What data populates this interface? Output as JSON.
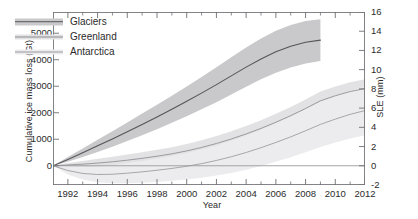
{
  "chart_data": {
    "type": "line",
    "title": "",
    "xlabel": "Year",
    "ylabel": "Cumulative ice mass loss (Gt)",
    "y2label": "SLE (mm)",
    "xlim": [
      1991,
      2012
    ],
    "ylim": [
      -726,
      5800
    ],
    "y2lim": [
      -2,
      16
    ],
    "grid": false,
    "legend_position": "top-left",
    "xticks": [
      1992,
      1994,
      1996,
      1998,
      2000,
      2002,
      2004,
      2006,
      2008,
      2010,
      2012
    ],
    "xticks_minor": [
      1993,
      1995,
      1997,
      1999,
      2001,
      2003,
      2005,
      2007,
      2009,
      2011
    ],
    "yticks": [
      0,
      1000,
      2000,
      3000,
      4000,
      5000
    ],
    "y2ticks": [
      -2,
      0,
      2,
      4,
      6,
      8,
      10,
      12,
      14,
      16
    ],
    "zero_line": 0,
    "series": [
      {
        "name": "Glaciers",
        "color": "#55555a",
        "band_color": "#c9c9cb",
        "x": [
          1991,
          1992,
          1993,
          1994,
          1995,
          1996,
          1997,
          1998,
          1999,
          2000,
          2001,
          2002,
          2003,
          2004,
          2005,
          2006,
          2007,
          2008,
          2009
        ],
        "values": [
          0,
          240,
          490,
          750,
          1010,
          1280,
          1560,
          1840,
          2130,
          2430,
          2740,
          3060,
          3390,
          3720,
          4030,
          4300,
          4510,
          4660,
          4740
        ],
        "lower": [
          0,
          150,
          330,
          520,
          720,
          930,
          1150,
          1380,
          1620,
          1870,
          2130,
          2400,
          2690,
          2980,
          3260,
          3510,
          3710,
          3860,
          3950
        ],
        "upper": [
          0,
          330,
          650,
          980,
          1300,
          1630,
          1970,
          2300,
          2640,
          2990,
          3350,
          3720,
          4090,
          4460,
          4800,
          5090,
          5310,
          5460,
          5530
        ]
      },
      {
        "name": "Greenland",
        "color": "#8d8d92",
        "band_color": "#e2e2e4",
        "x": [
          1991,
          1992,
          1993,
          1994,
          1995,
          1996,
          1997,
          1998,
          1999,
          2000,
          2001,
          2002,
          2003,
          2004,
          2005,
          2006,
          2007,
          2008,
          2009,
          2010,
          2011,
          2012
        ],
        "values": [
          0,
          30,
          60,
          100,
          150,
          210,
          280,
          360,
          450,
          560,
          690,
          840,
          1010,
          1200,
          1410,
          1640,
          1890,
          2160,
          2450,
          2640,
          2800,
          2910
        ],
        "lower": [
          0,
          -40,
          -60,
          -60,
          -40,
          0,
          50,
          120,
          200,
          300,
          420,
          560,
          720,
          900,
          1100,
          1320,
          1560,
          1820,
          2100,
          2290,
          2450,
          2560
        ],
        "upper": [
          0,
          100,
          180,
          260,
          340,
          420,
          510,
          600,
          700,
          820,
          960,
          1120,
          1300,
          1500,
          1720,
          1960,
          2220,
          2500,
          2800,
          2990,
          3150,
          3260
        ]
      },
      {
        "name": "Antarctica",
        "color": "#9a9a9e",
        "band_color": "#ececee",
        "x": [
          1991,
          1992,
          1993,
          1994,
          1995,
          1996,
          1997,
          1998,
          1999,
          2000,
          2001,
          2002,
          2003,
          2004,
          2005,
          2006,
          2007,
          2008,
          2009,
          2010,
          2011,
          2012
        ],
        "values": [
          0,
          -180,
          -290,
          -330,
          -320,
          -280,
          -230,
          -170,
          -100,
          -20,
          80,
          200,
          340,
          500,
          680,
          880,
          1090,
          1320,
          1560,
          1760,
          1940,
          2080
        ],
        "lower": [
          0,
          -330,
          -520,
          -620,
          -660,
          -660,
          -640,
          -610,
          -570,
          -520,
          -450,
          -370,
          -270,
          -150,
          -10,
          150,
          320,
          510,
          710,
          880,
          1030,
          1150
        ],
        "upper": [
          0,
          -30,
          -60,
          -40,
          20,
          100,
          180,
          270,
          370,
          480,
          610,
          760,
          940,
          1140,
          1360,
          1600,
          1860,
          2130,
          2410,
          2630,
          2830,
          2990
        ]
      }
    ]
  }
}
